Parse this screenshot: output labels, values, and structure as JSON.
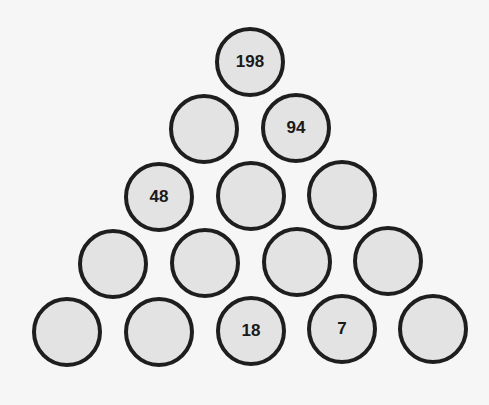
{
  "puzzle": {
    "type": "number-pyramid",
    "colors": {
      "background": "#f6f6f6",
      "cell_fill": "#e3e3e3",
      "cell_border": "#1e1e1e",
      "text": "#1a1a1a"
    },
    "rows": [
      {
        "cells": [
          {
            "value": "198",
            "x": 249,
            "y": 61
          }
        ]
      },
      {
        "cells": [
          {
            "value": "",
            "x": 203,
            "y": 128
          },
          {
            "value": "94",
            "x": 295,
            "y": 127
          }
        ]
      },
      {
        "cells": [
          {
            "value": "48",
            "x": 158,
            "y": 196
          },
          {
            "value": "",
            "x": 250,
            "y": 195
          },
          {
            "value": "",
            "x": 341,
            "y": 194
          }
        ]
      },
      {
        "cells": [
          {
            "value": "",
            "x": 112,
            "y": 263
          },
          {
            "value": "",
            "x": 204,
            "y": 262
          },
          {
            "value": "",
            "x": 296,
            "y": 261
          },
          {
            "value": "",
            "x": 387,
            "y": 260
          }
        ]
      },
      {
        "cells": [
          {
            "value": "",
            "x": 66,
            "y": 331
          },
          {
            "value": "",
            "x": 158,
            "y": 331
          },
          {
            "value": "18",
            "x": 250,
            "y": 330
          },
          {
            "value": "7",
            "x": 341,
            "y": 328
          },
          {
            "value": "",
            "x": 432,
            "y": 328
          }
        ]
      }
    ]
  }
}
